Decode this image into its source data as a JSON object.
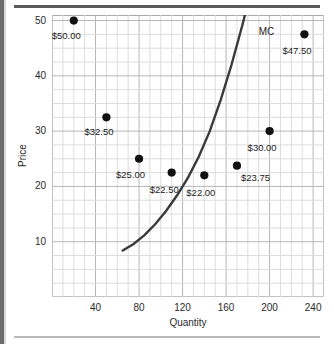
{
  "chart_data": {
    "type": "scatter",
    "title": "",
    "xlabel": "Quantity",
    "ylabel": "Price",
    "xlim": [
      0,
      250
    ],
    "ylim": [
      0,
      51
    ],
    "grid": true,
    "x_ticks": [
      40,
      80,
      120,
      160,
      200,
      240
    ],
    "y_ticks": [
      10,
      20,
      30,
      40,
      50
    ],
    "minor_grid_x_step": 10,
    "minor_grid_y_step": 2.5,
    "legend_position": "inline-annotation",
    "series": [
      {
        "name": "Price points",
        "type": "scatter",
        "marker": "filled-circle",
        "color": "#111111",
        "points": [
          {
            "x": 20,
            "y": 50.0,
            "label": "$50.00",
            "label_dx": -22,
            "label_dy": 9
          },
          {
            "x": 50,
            "y": 32.5,
            "label": "$32.50",
            "label_dx": -22,
            "label_dy": 9
          },
          {
            "x": 80,
            "y": 25.0,
            "label": "$25.00",
            "label_dx": -23,
            "label_dy": 10
          },
          {
            "x": 110,
            "y": 22.5,
            "label": "$22.50",
            "label_dx": -22,
            "label_dy": 11
          },
          {
            "x": 140,
            "y": 22.0,
            "label": "$22.00",
            "label_dx": -18,
            "label_dy": 12
          },
          {
            "x": 170,
            "y": 23.75,
            "label": "$23.75",
            "label_dx": 4,
            "label_dy": 6
          },
          {
            "x": 200,
            "y": 30.0,
            "label": "$30.00",
            "label_dx": -22,
            "label_dy": 11
          },
          {
            "x": 232,
            "y": 47.5,
            "label": "$47.50",
            "label_dx": -22,
            "label_dy": 11
          }
        ]
      },
      {
        "name": "MC",
        "type": "line",
        "color": "#3a3a3a",
        "annotation": "MC",
        "annotation_x": 190,
        "annotation_y": 48.0,
        "points": [
          {
            "x": 65,
            "y": 8.4
          },
          {
            "x": 75,
            "y": 9.6
          },
          {
            "x": 85,
            "y": 11.2
          },
          {
            "x": 95,
            "y": 13.2
          },
          {
            "x": 105,
            "y": 15.6
          },
          {
            "x": 115,
            "y": 18.4
          },
          {
            "x": 125,
            "y": 21.6
          },
          {
            "x": 135,
            "y": 25.4
          },
          {
            "x": 145,
            "y": 30.0
          },
          {
            "x": 155,
            "y": 35.6
          },
          {
            "x": 165,
            "y": 42.0
          },
          {
            "x": 175,
            "y": 49.2
          },
          {
            "x": 178,
            "y": 51.5
          }
        ]
      }
    ]
  }
}
